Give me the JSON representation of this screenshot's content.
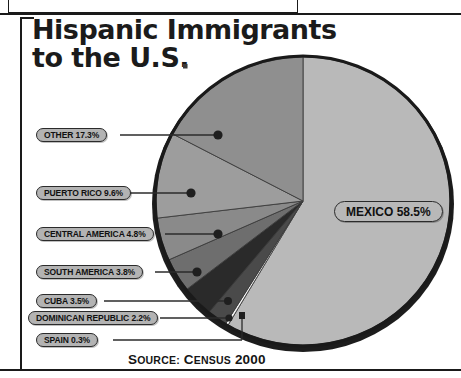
{
  "title": {
    "line1": "Hispanic Immigrants",
    "line2": "to the U.S."
  },
  "source": {
    "prefix_cap": "S",
    "prefix_rest": "OURCE:",
    "value_cap": "C",
    "value_rest": "ENSUS",
    "year": "2000",
    "full": "SOURCE: CENSUS 2000"
  },
  "colors": {
    "pill_fill": "#b3b3b3",
    "pill_border": "#2b2b2b",
    "pie_rim": "#1a1a1a",
    "page_bg": "#ffffff",
    "text": "#111111"
  },
  "chart_data": {
    "type": "pie",
    "title": "Hispanic Immigrants to the U.S.",
    "unit": "percent",
    "start_angle_deg": 0,
    "direction": "clockwise",
    "legend": "callout labels with leader lines",
    "grid": false,
    "categories": [
      "MEXICO",
      "SPAIN",
      "DOMINICAN REPUBLIC",
      "CUBA",
      "SOUTH AMERICA",
      "CENTRAL AMERICA",
      "PUERTO RICO",
      "OTHER"
    ],
    "values": [
      58.5,
      0.3,
      2.2,
      3.5,
      3.8,
      4.8,
      9.6,
      17.3
    ],
    "slices": [
      {
        "name": "MEXICO",
        "label": "MEXICO 58.5%",
        "value": 58.5,
        "color": "#b9b9b9"
      },
      {
        "name": "SPAIN",
        "label": "SPAIN 0.3%",
        "value": 0.3,
        "color": "#f2f2f2"
      },
      {
        "name": "DOMINICAN REPUBLIC",
        "label": "DOMINICAN REPUBLIC 2.2%",
        "value": 2.2,
        "color": "#4a4a4a"
      },
      {
        "name": "CUBA",
        "label": "CUBA 3.5%",
        "value": 3.5,
        "color": "#2a2a2a"
      },
      {
        "name": "SOUTH AMERICA",
        "label": "SOUTH AMERICA 3.8%",
        "value": 3.8,
        "color": "#6e6e6e"
      },
      {
        "name": "CENTRAL AMERICA",
        "label": "CENTRAL AMERICA 4.8%",
        "value": 4.8,
        "color": "#8a8a8a"
      },
      {
        "name": "PUERTO RICO",
        "label": "PUERTO RICO 9.6%",
        "value": 9.6,
        "color": "#9d9d9d"
      },
      {
        "name": "OTHER",
        "label": "OTHER 17.3%",
        "value": 17.3,
        "color": "#8f8f8f"
      }
    ]
  },
  "callouts": {
    "other": "OTHER 17.3%",
    "puerto_rico": "PUERTO RICO 9.6%",
    "central_america": "CENTRAL AMERICA 4.8%",
    "south_america": "SOUTH AMERICA 3.8%",
    "cuba": "CUBA 3.5%",
    "dominican_republic": "DOMINICAN REPUBLIC 2.2%",
    "spain": "SPAIN 0.3%",
    "mexico": "MEXICO 58.5%"
  }
}
